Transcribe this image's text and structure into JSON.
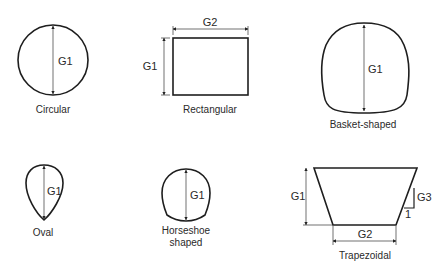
{
  "shapes": [
    {
      "name": "Circular",
      "label": "Circular",
      "dims": {
        "g1": "G1"
      }
    },
    {
      "name": "Rectangular",
      "label": "Rectangular",
      "dims": {
        "g1": "G1",
        "g2": "G2"
      }
    },
    {
      "name": "Basket-shaped",
      "label": "Basket-shaped",
      "dims": {
        "g1": "G1"
      }
    },
    {
      "name": "Oval",
      "label": "Oval",
      "dims": {
        "g1": "G1"
      }
    },
    {
      "name": "Horseshoe shaped",
      "label_line1": "Horseshoe",
      "label_line2": "shaped",
      "dims": {
        "g1": "G1"
      }
    },
    {
      "name": "Trapezoidal",
      "label": "Trapezoidal",
      "dims": {
        "g1": "G1",
        "g2": "G2",
        "g3": "G3",
        "slope": "1"
      }
    }
  ],
  "colors": {
    "line": "#1e1e1e",
    "text": "#2a2a2a",
    "background": "#ffffff"
  }
}
